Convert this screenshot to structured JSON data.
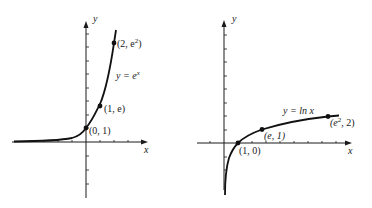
{
  "diagrams": [
    {
      "name": "exponential",
      "axis_labels": {
        "x": "x",
        "y": "y"
      },
      "curve_label": {
        "prefix": "y = e",
        "sup": "x"
      },
      "points": [
        {
          "label": "(0, 1)",
          "x": 0,
          "y": 1
        },
        {
          "label": "(1, e)",
          "x": 1,
          "y": 2.718
        },
        {
          "label_prefix": "(2, e",
          "label_sup": "2",
          "label_suffix": ")",
          "x": 2,
          "y": 7.389
        }
      ]
    },
    {
      "name": "natural-log",
      "axis_labels": {
        "x": "x",
        "y": "y"
      },
      "curve_label": {
        "text": "y = ln x"
      },
      "points": [
        {
          "label": "(1, 0)",
          "x": 1,
          "y": 0
        },
        {
          "label": "(e, 1)",
          "x": 2.718,
          "y": 1
        },
        {
          "label_prefix": "(e",
          "label_sup": "2",
          "label_suffix": ", 2)",
          "x": 7.389,
          "y": 2
        }
      ]
    }
  ],
  "colors": {
    "ink": "#111111",
    "background": "#ffffff"
  }
}
